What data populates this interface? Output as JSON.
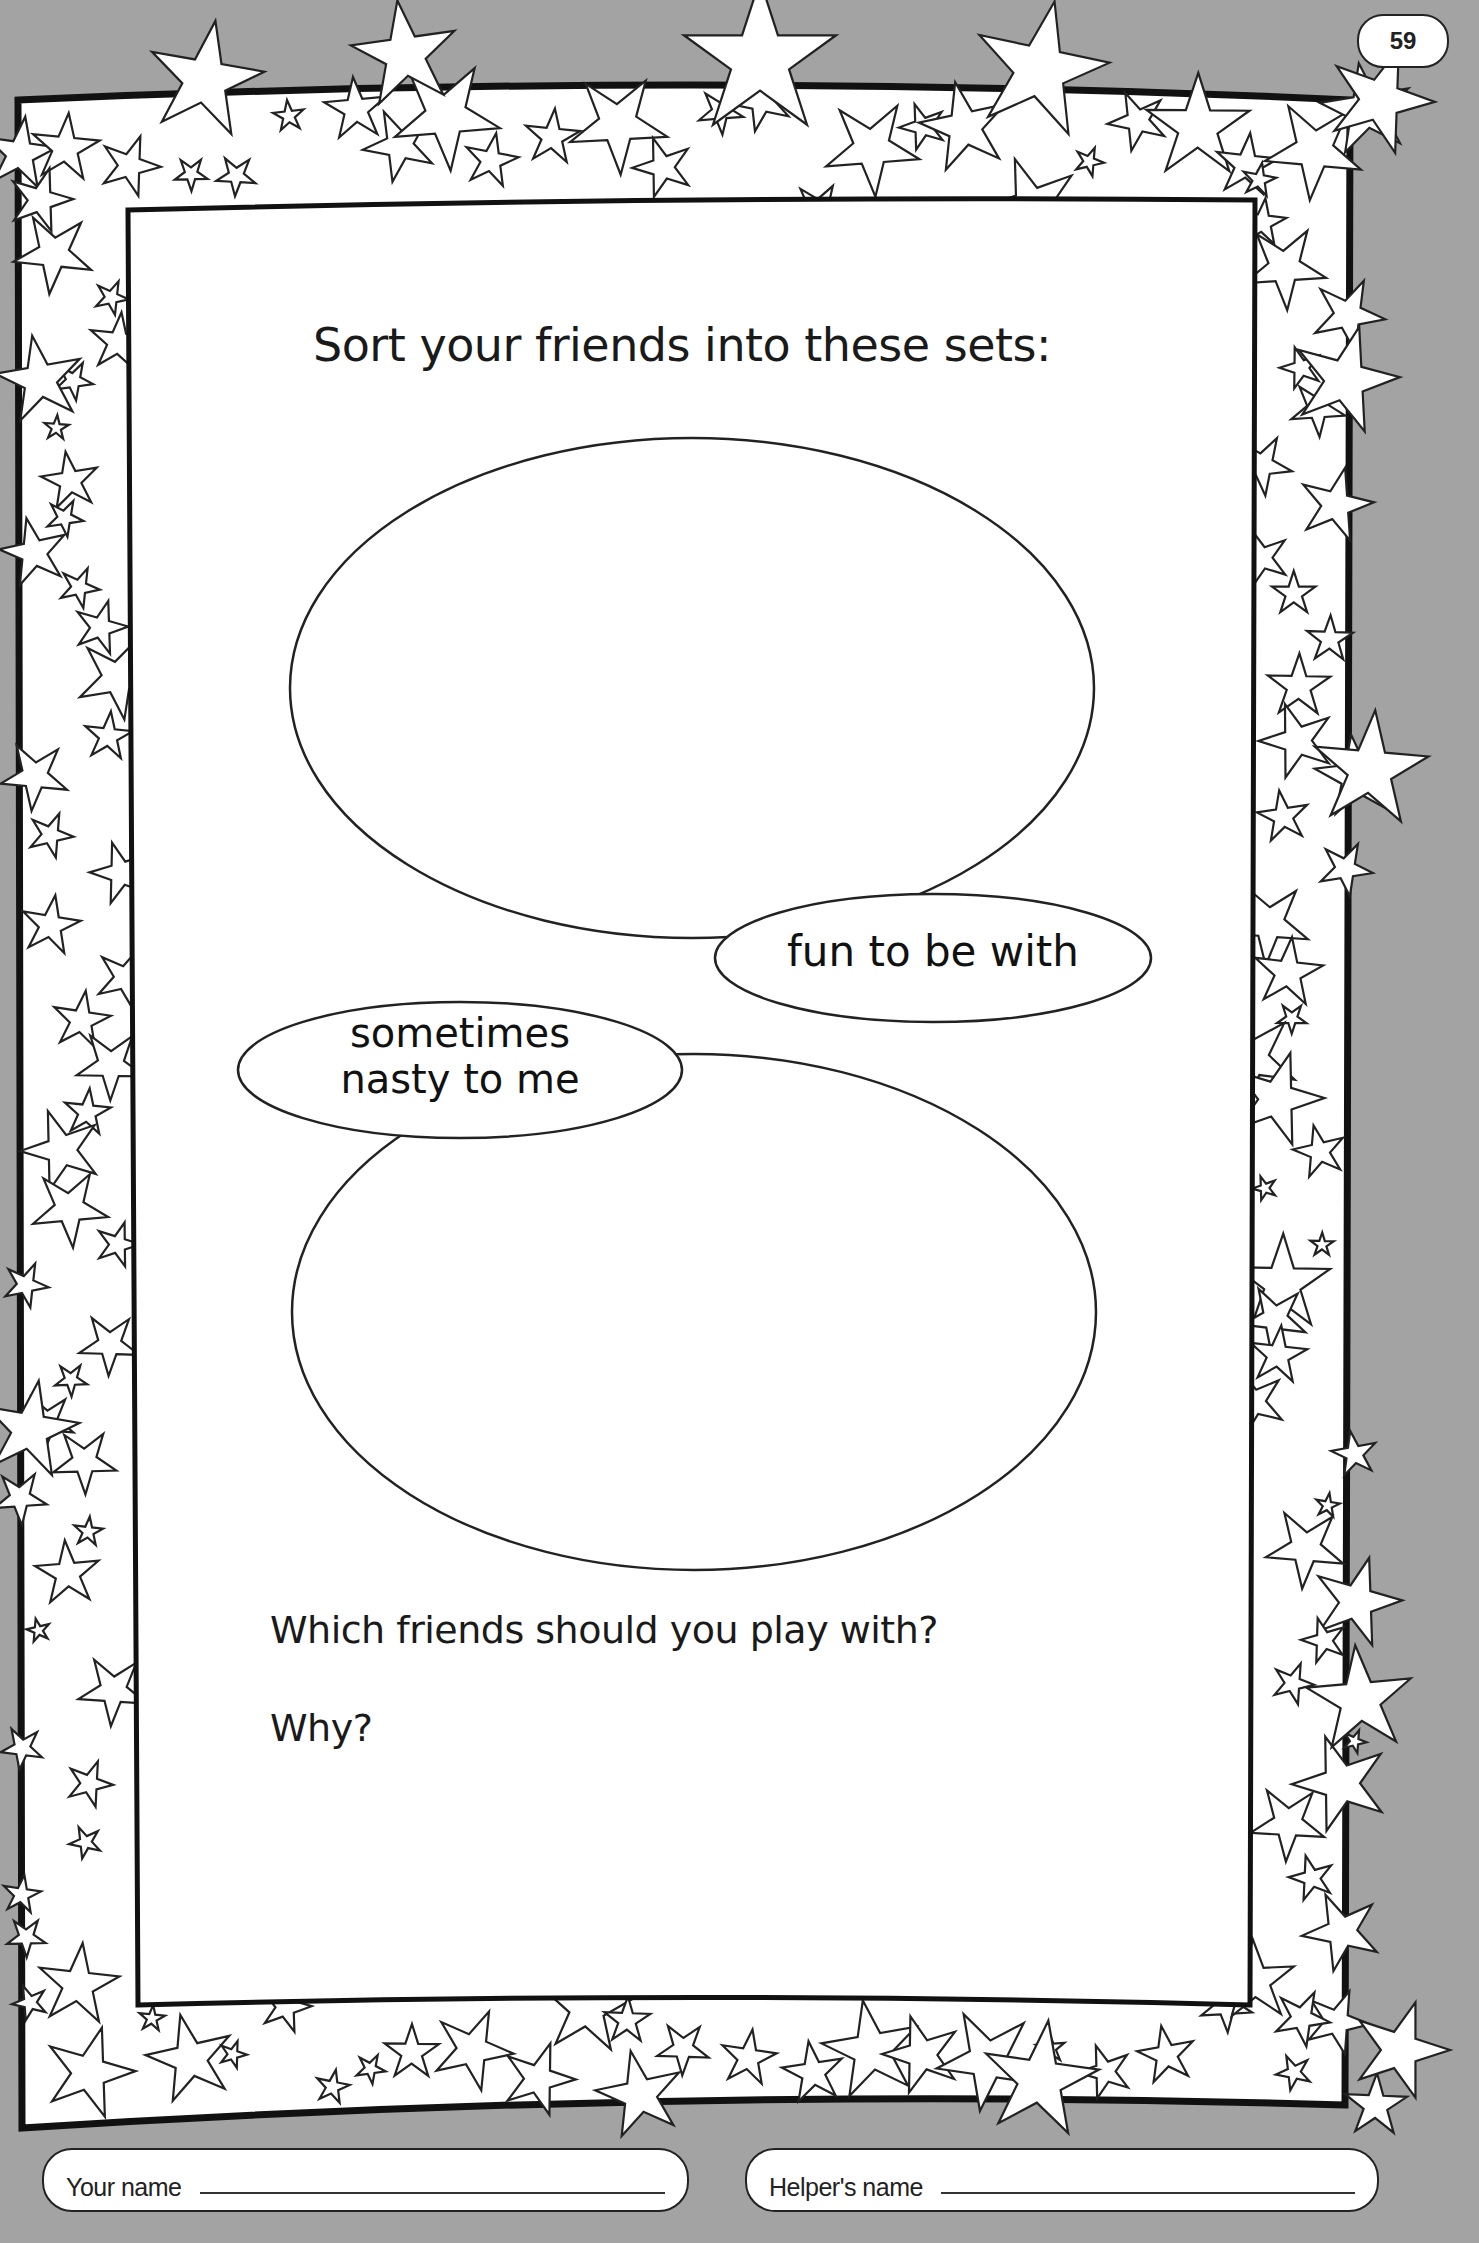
{
  "page": {
    "number": "59",
    "background_color": "#a3a3a3",
    "border_style": "star-decorated frame"
  },
  "worksheet": {
    "title": "Sort your friends into these sets:",
    "sets": [
      {
        "label": "fun to be with",
        "label_lines": [
          "fun to be with"
        ]
      },
      {
        "label": "sometimes nasty to me",
        "label_lines": [
          "sometimes",
          "nasty to me"
        ]
      }
    ],
    "questions": [
      "Which friends should you play with?",
      "Why?"
    ]
  },
  "footer": {
    "your_name_label": "Your name",
    "helpers_name_label": "Helper's name"
  }
}
